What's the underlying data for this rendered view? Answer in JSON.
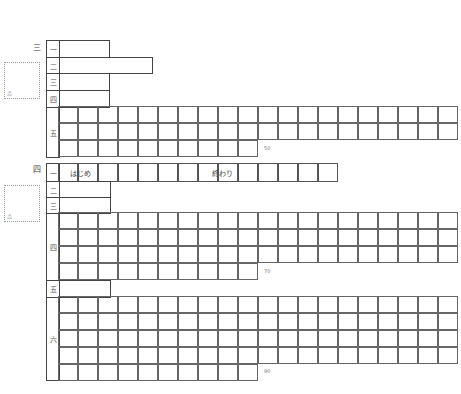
{
  "sheet": {
    "orientation": "rotated-90",
    "section_upper": {
      "number": "三",
      "score_mark": "点",
      "rows": [
        {
          "label": "一"
        },
        {
          "label": "二"
        },
        {
          "label": "三"
        },
        {
          "label": "四"
        },
        {
          "label": "五",
          "grid_rows": 3,
          "char_limit": "50"
        }
      ]
    },
    "section_lower": {
      "number": "四",
      "score_mark": "点",
      "rows": [
        {
          "label": "一",
          "start_text": "はじめ",
          "end_text": "終わり"
        },
        {
          "label": "二"
        },
        {
          "label": "三"
        },
        {
          "label": "四",
          "grid_rows": 4,
          "char_limit": "70"
        },
        {
          "label": "五"
        },
        {
          "label": "六",
          "grid_rows": 5,
          "char_limit": "90"
        }
      ]
    }
  }
}
